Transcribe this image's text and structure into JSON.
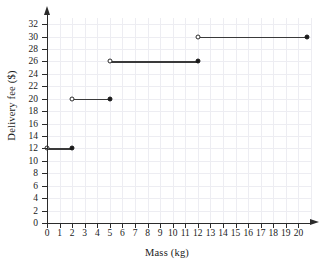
{
  "chart_data": {
    "type": "line",
    "subtype": "step-function",
    "title": "",
    "xlabel": "Mass (kg)",
    "ylabel": "Delivery fee ($)",
    "xlim": [
      0,
      21
    ],
    "ylim": [
      0,
      33
    ],
    "grid": true,
    "legend": "none",
    "x_ticks": [
      0,
      1,
      2,
      3,
      4,
      5,
      6,
      7,
      8,
      9,
      10,
      11,
      12,
      13,
      14,
      15,
      16,
      17,
      18,
      19,
      20
    ],
    "y_ticks": [
      0,
      2,
      4,
      6,
      8,
      10,
      12,
      14,
      16,
      18,
      20,
      22,
      24,
      26,
      28,
      30,
      32
    ],
    "x_tick_labels": [
      "0",
      "1",
      "2",
      "3",
      "4",
      "5",
      "6",
      "7",
      "8",
      "9",
      "10",
      "11",
      "12",
      "13",
      "14",
      "15",
      "16",
      "17",
      "18",
      "19",
      "20"
    ],
    "y_tick_labels": [
      "0",
      "2",
      "4",
      "6",
      "8",
      "10",
      "12",
      "14",
      "16",
      "18",
      "20",
      "22",
      "24",
      "26",
      "28",
      "30",
      "32"
    ],
    "series": [
      {
        "name": "Delivery fee",
        "segments": [
          {
            "x_start": 0,
            "x_end": 2,
            "y": 12,
            "start_marker": "open",
            "end_marker": "closed"
          },
          {
            "x_start": 2,
            "x_end": 5,
            "y": 20,
            "start_marker": "open",
            "end_marker": "closed"
          },
          {
            "x_start": 5,
            "x_end": 12,
            "y": 26,
            "start_marker": "open",
            "end_marker": "closed"
          },
          {
            "x_start": 12,
            "x_end": 20.7,
            "y": 30,
            "start_marker": "open",
            "end_marker": "closed"
          }
        ]
      }
    ],
    "colors": {
      "line": "#3a3a3a",
      "axis": "#2b2b2b",
      "grid": "#ededf2",
      "background": "#ffffff",
      "text": "#1a1a1a"
    }
  }
}
